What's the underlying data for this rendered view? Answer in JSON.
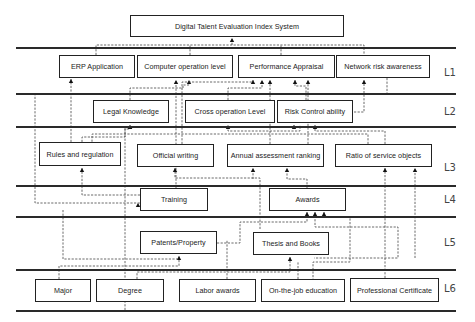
{
  "diagram": {
    "title": "Digital Talent Evaluation Index System",
    "levels": [
      {
        "id": "L1",
        "label": "L1",
        "y": 74
      },
      {
        "id": "L2",
        "label": "L2",
        "y": 113
      },
      {
        "id": "L3",
        "label": "L3",
        "y": 169
      },
      {
        "id": "L4",
        "label": "L4",
        "y": 201
      },
      {
        "id": "L5",
        "label": "L5",
        "y": 244
      },
      {
        "id": "L6",
        "label": "L6",
        "y": 290
      }
    ],
    "separators_y": [
      47,
      93,
      126,
      185,
      216,
      269,
      310
    ],
    "nodes": [
      {
        "id": "root",
        "label": "Digital Talent Evaluation Index System",
        "level": "L0",
        "x": 130,
        "y": 15,
        "w": 214,
        "h": 22
      },
      {
        "id": "erp",
        "label": "ERP Application",
        "level": "L1",
        "x": 59,
        "y": 55,
        "w": 76,
        "h": 23
      },
      {
        "id": "comp",
        "label": "Computer operation level",
        "level": "L1",
        "x": 137,
        "y": 55,
        "w": 96,
        "h": 23
      },
      {
        "id": "perf",
        "label": "Performance Appraisal",
        "level": "L1",
        "x": 238,
        "y": 55,
        "w": 97,
        "h": 23
      },
      {
        "id": "net",
        "label": "Network risk awareness",
        "level": "L1",
        "x": 336,
        "y": 55,
        "w": 94,
        "h": 23
      },
      {
        "id": "legal",
        "label": "Legal Knowledge",
        "level": "L2",
        "x": 93,
        "y": 100,
        "w": 76,
        "h": 23
      },
      {
        "id": "cross",
        "label": "Cross operation Level",
        "level": "L2",
        "x": 185,
        "y": 100,
        "w": 90,
        "h": 23
      },
      {
        "id": "risk",
        "label": "Risk Control ability",
        "level": "L2",
        "x": 277,
        "y": 100,
        "w": 76,
        "h": 23
      },
      {
        "id": "rules",
        "label": "Rules and regulation",
        "level": "L3",
        "x": 39,
        "y": 142,
        "w": 82,
        "h": 24
      },
      {
        "id": "writing",
        "label": "Official writing",
        "level": "L3",
        "x": 137,
        "y": 144,
        "w": 77,
        "h": 23
      },
      {
        "id": "annual",
        "label": "Annual assessment ranking",
        "level": "L3",
        "x": 227,
        "y": 144,
        "w": 97,
        "h": 23
      },
      {
        "id": "ratio",
        "label": "Ratio of service objects",
        "level": "L3",
        "x": 335,
        "y": 144,
        "w": 97,
        "h": 23
      },
      {
        "id": "training",
        "label": "Training",
        "level": "L4",
        "x": 140,
        "y": 188,
        "w": 68,
        "h": 23
      },
      {
        "id": "awards",
        "label": "Awards",
        "level": "L4",
        "x": 269,
        "y": 188,
        "w": 77,
        "h": 23
      },
      {
        "id": "patents",
        "label": "Patents/Property",
        "level": "L5",
        "x": 140,
        "y": 231,
        "w": 77,
        "h": 23
      },
      {
        "id": "thesis",
        "label": "Thesis and Books",
        "level": "L5",
        "x": 253,
        "y": 232,
        "w": 76,
        "h": 23
      },
      {
        "id": "major",
        "label": "Major",
        "level": "L6",
        "x": 35,
        "y": 279,
        "w": 56,
        "h": 23
      },
      {
        "id": "degree",
        "label": "Degree",
        "level": "L6",
        "x": 96,
        "y": 279,
        "w": 68,
        "h": 23
      },
      {
        "id": "labor",
        "label": "Labor awards",
        "level": "L6",
        "x": 179,
        "y": 279,
        "w": 77,
        "h": 23
      },
      {
        "id": "onjob",
        "label": "On-the-job education",
        "level": "L6",
        "x": 261,
        "y": 279,
        "w": 84,
        "h": 23
      },
      {
        "id": "cert",
        "label": "Professional Certificate",
        "level": "L6",
        "x": 350,
        "y": 278,
        "w": 89,
        "h": 24
      }
    ],
    "edges": [
      {
        "from": "erp",
        "to": "root",
        "path": "M96 55 V45 H364 V55 M190 55 V45 M281 55 V45 M232 45 V38",
        "arrow": [
          232,
          38
        ]
      },
      {
        "from": "rules",
        "to": "erp",
        "path": "M71 142 V79",
        "arrow": [
          71,
          79
        ]
      },
      {
        "from": "training",
        "to": "comp",
        "path": "M176 188 V80",
        "arrow": [
          176,
          80
        ]
      },
      {
        "from": "legal",
        "to": "comp",
        "path": "M130 100 V88 H183 V85 H189 V80",
        "arrow": [
          189,
          80
        ]
      },
      {
        "from": "writing",
        "to": "perf",
        "path": "M182 144 V82 H253 V80",
        "arrow": [
          253,
          80
        ]
      },
      {
        "from": "cross",
        "to": "perf",
        "path": "M228 100 V88 H262 V80",
        "arrow": [
          262,
          80
        ]
      },
      {
        "from": "annual",
        "to": "perf",
        "path": "M270 144 V80",
        "arrow": [
          270,
          80
        ]
      },
      {
        "from": "risk",
        "to": "perf",
        "path": "M306 100 V86 H295 V80",
        "arrow": [
          295,
          80
        ]
      },
      {
        "from": "ratio",
        "to": "perf",
        "path": "M308 144 V80",
        "arrow": [
          308,
          80
        ]
      },
      {
        "from": "risk",
        "to": "net",
        "path": "M354 112 H364 V80",
        "arrow": [
          364,
          80
        ]
      },
      {
        "from": "net",
        "to": "training",
        "path": "M387 78 V94 H35 V203 H140",
        "arrow": [
          138,
          203
        ]
      },
      {
        "from": "rules",
        "to": "legal",
        "path": "M82 142 V137 H125 V129 H130 V125",
        "arrow": [
          130,
          125
        ]
      },
      {
        "from": "training",
        "to": "legal",
        "path": "M125 310 V128",
        "arrow": [
          130,
          125
        ]
      },
      {
        "from": "annual",
        "to": "cross",
        "path": "M228 126 V131 H300 V125",
        "arrow": [
          228,
          125
        ]
      },
      {
        "from": "annual",
        "to": "risk",
        "path": "M294 126 V125",
        "arrow": [
          294,
          125
        ]
      },
      {
        "from": "ratio",
        "to": "risk",
        "path": "M385 144 V131 H315 V125",
        "arrow": [
          315,
          125
        ]
      },
      {
        "from": "ratio",
        "to": "risk2",
        "path": "M368 144 V134 H92 V142",
        "arrow": null
      },
      {
        "from": "training",
        "to": "rules",
        "path": "M140 195 H82 V168",
        "arrow": [
          82,
          168
        ]
      },
      {
        "from": "labor",
        "to": "writing",
        "path": "M260 229 V178 H175 V168",
        "arrow": [
          175,
          168
        ]
      },
      {
        "from": "awards",
        "to": "annual",
        "path": "M307 188 V179 H287 V168",
        "arrow": [
          287,
          168
        ]
      },
      {
        "from": "onjob",
        "to": "annual",
        "path": "M253 179 V168",
        "arrow": [
          253,
          168
        ]
      },
      {
        "from": "cert",
        "to": "ratio",
        "path": "M385 278 V168",
        "arrow": [
          385,
          168
        ]
      },
      {
        "from": "cert2",
        "to": "ratio",
        "path": "M415 258 V168",
        "arrow": [
          415,
          168
        ]
      },
      {
        "from": "patents",
        "to": "awards",
        "path": "M217 243 H240 V222 H307 V212",
        "arrow": [
          307,
          212
        ]
      },
      {
        "from": "thesis",
        "to": "awards",
        "path": "M315 212 V227 H398 V258 H314",
        "arrow": [
          315,
          212
        ]
      },
      {
        "from": "onjob2",
        "to": "awards",
        "path": "M324 212 V217 H350 V262 H313 V279",
        "arrow": [
          324,
          212
        ]
      },
      {
        "from": "major",
        "to": "patents",
        "path": "M59 279 V266 H179 V256",
        "arrow": [
          179,
          256
        ]
      },
      {
        "from": "degree",
        "to": "patents",
        "path": "M63 210 V259 H179",
        "arrow": null
      },
      {
        "from": "degree2",
        "to": "thesis",
        "path": "M137 279 V272 H290 V257",
        "arrow": [
          290,
          257
        ]
      },
      {
        "from": "labor2",
        "to": "thesis",
        "path": "M227 279 V240",
        "arrow": null
      },
      {
        "from": "onjob3",
        "to": "thesis",
        "path": "M298 279 V262",
        "arrow": null
      }
    ]
  }
}
